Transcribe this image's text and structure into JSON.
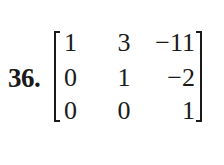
{
  "problem": {
    "number": "36.",
    "matrix": {
      "rows": [
        [
          "1",
          "3",
          "−11"
        ],
        [
          "0",
          "1",
          "−2"
        ],
        [
          "0",
          "0",
          "1"
        ]
      ]
    }
  }
}
